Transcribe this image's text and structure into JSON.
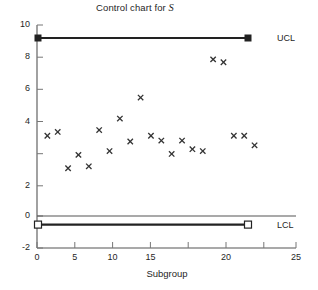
{
  "chart_data": {
    "type": "scatter",
    "title": "Control chart for S",
    "title_plain": "Control chart for ",
    "title_variable": "S",
    "xlabel": "Subgroup",
    "ylabel": "",
    "xlim": [
      0,
      25
    ],
    "ylim": [
      -2,
      10
    ],
    "xticks": [
      0,
      5,
      10,
      15,
      20,
      25
    ],
    "xtick_labels": [
      "0",
      "5",
      "10",
      "15",
      "20",
      "25"
    ],
    "yticks": [
      -2,
      0,
      2,
      4,
      6,
      8,
      10
    ],
    "ytick_labels": [
      "-2",
      "0",
      "2",
      "4",
      "6",
      "8",
      "10"
    ],
    "grid": false,
    "legend": "none",
    "marker": "x",
    "marker_color": "#333333",
    "x": [
      1,
      2,
      3,
      4,
      5,
      6,
      7,
      8,
      9,
      10,
      11,
      12,
      13,
      14,
      15,
      16,
      17,
      18,
      19,
      20,
      21
    ],
    "values": [
      4.2,
      4.4,
      2.5,
      3.2,
      2.6,
      4.5,
      3.4,
      5.1,
      3.9,
      6.2,
      4.2,
      3.95,
      3.25,
      3.95,
      3.5,
      3.4,
      8.2,
      8.05,
      4.2,
      4.2,
      3.7
    ],
    "series": [
      {
        "name": "S",
        "values": [
          4.2,
          4.4,
          2.5,
          3.2,
          2.6,
          4.5,
          3.4,
          5.1,
          3.9,
          6.2,
          4.2,
          3.95,
          3.25,
          3.95,
          3.5,
          3.4,
          8.2,
          8.05,
          4.2,
          4.2,
          3.7
        ]
      }
    ],
    "control_limits": [
      {
        "name": "UCL",
        "label": "UCL",
        "value": 9.3,
        "x_start": 0,
        "x_end": 21,
        "marker": "filled-square",
        "color": "#222222"
      },
      {
        "name": "LCL",
        "label": "LCL",
        "value": -0.45,
        "x_start": 0,
        "x_end": 21,
        "marker": "open-square",
        "color": "#222222"
      }
    ],
    "reference_lines": [
      {
        "name": "zero-line",
        "value": 0,
        "x_start": 0,
        "x_end": 25,
        "color": "#555555"
      }
    ],
    "annotations": [
      {
        "name": "ucl-label",
        "text": "UCL",
        "value": 9.3
      },
      {
        "name": "lcl-label",
        "text": "LCL",
        "value": -0.45
      }
    ]
  }
}
